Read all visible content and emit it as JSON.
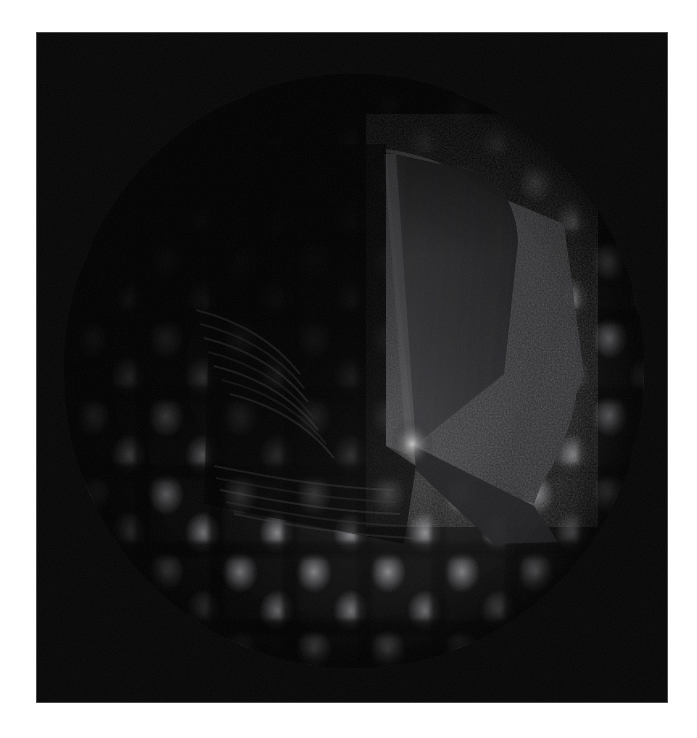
{
  "page": {
    "background_color": "#ffffff",
    "width": 697,
    "height": 738
  },
  "render_panel": {
    "name": "3d-render-viewport",
    "background_color": "#050505",
    "left": 36,
    "top": 32,
    "width": 632,
    "height": 671,
    "caption": ""
  },
  "scene": {
    "subject": "checkered sphere with radial wedge cutaway",
    "lighting": "single light source from lower right, strong terminator in upper left",
    "center_x": 318,
    "center_y": 339,
    "radius_x": 290,
    "radius_y": 297,
    "surface_pattern": "checkerboard of rounded dimple cells",
    "pattern_colors": {
      "cell_highlight": "#98989c",
      "cell_mid": "#68686c",
      "seam_dark": "#000000",
      "sphere_base": "#0a0a0b"
    }
  },
  "wedge": {
    "name": "cutaway-wedge",
    "description": "radial pie-slice removed from the sphere exposing the interior",
    "apex_x": 350,
    "apex_y": 372,
    "top_edge_angle_deg": 90,
    "lower_edge_angle_deg": 22,
    "cut_plane_color": "#3a3a3c",
    "inner_noise_color": "#4a4a4d",
    "apex_highlight_color": "#c8c8c8"
  },
  "grain": {
    "name": "film-grain-overlay",
    "opacity": 0.3,
    "description": "fine monochrome sensor noise across the render"
  },
  "labels": {
    "alt_text": "Dark three dimensional render of a checkered sphere with a wedge shaped section cut away"
  }
}
